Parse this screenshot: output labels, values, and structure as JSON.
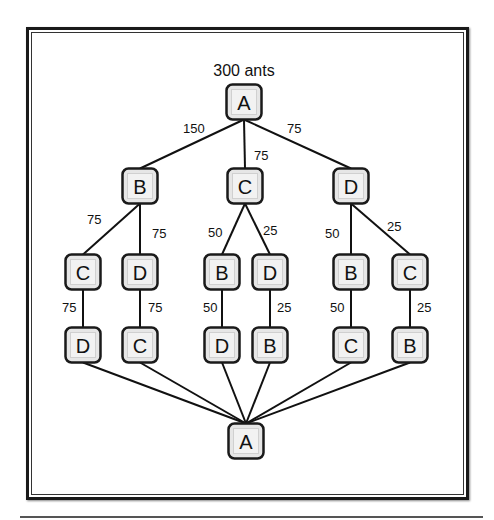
{
  "diagram": {
    "title": "300 ants",
    "node_size": 35,
    "colors": {
      "node_fill": "#e6e6e6",
      "node_inner": "#f2f2f2",
      "node_border": "#1a1a1a",
      "edge": "#111111"
    },
    "nodes": [
      {
        "id": "n0",
        "label": "A",
        "x": 244,
        "y": 102
      },
      {
        "id": "n1",
        "label": "B",
        "x": 140,
        "y": 186
      },
      {
        "id": "n2",
        "label": "C",
        "x": 245,
        "y": 186
      },
      {
        "id": "n3",
        "label": "D",
        "x": 351,
        "y": 186
      },
      {
        "id": "n4",
        "label": "C",
        "x": 83,
        "y": 272
      },
      {
        "id": "n5",
        "label": "D",
        "x": 140,
        "y": 272
      },
      {
        "id": "n6",
        "label": "B",
        "x": 222,
        "y": 272
      },
      {
        "id": "n7",
        "label": "D",
        "x": 270,
        "y": 272
      },
      {
        "id": "n8",
        "label": "B",
        "x": 351,
        "y": 272
      },
      {
        "id": "n9",
        "label": "C",
        "x": 410,
        "y": 272
      },
      {
        "id": "n10",
        "label": "D",
        "x": 83,
        "y": 345
      },
      {
        "id": "n11",
        "label": "C",
        "x": 140,
        "y": 345
      },
      {
        "id": "n12",
        "label": "D",
        "x": 222,
        "y": 345
      },
      {
        "id": "n13",
        "label": "B",
        "x": 270,
        "y": 345
      },
      {
        "id": "n14",
        "label": "C",
        "x": 351,
        "y": 345
      },
      {
        "id": "n15",
        "label": "B",
        "x": 410,
        "y": 345
      },
      {
        "id": "n16",
        "label": "A",
        "x": 246,
        "y": 441
      }
    ],
    "edges": [
      {
        "from": "n0",
        "to": "n1",
        "label": "150",
        "lx": 183,
        "ly": 133
      },
      {
        "from": "n0",
        "to": "n2",
        "label": "75",
        "lx": 254,
        "ly": 160
      },
      {
        "from": "n0",
        "to": "n3",
        "label": "75",
        "lx": 287,
        "ly": 133
      },
      {
        "from": "n1",
        "to": "n4",
        "label": "75",
        "lx": 87,
        "ly": 224
      },
      {
        "from": "n1",
        "to": "n5",
        "label": "75",
        "lx": 152,
        "ly": 238
      },
      {
        "from": "n2",
        "to": "n6",
        "label": "50",
        "lx": 208,
        "ly": 237
      },
      {
        "from": "n2",
        "to": "n7",
        "label": "25",
        "lx": 263,
        "ly": 235
      },
      {
        "from": "n3",
        "to": "n8",
        "label": "50",
        "lx": 325,
        "ly": 238
      },
      {
        "from": "n3",
        "to": "n9",
        "label": "25",
        "lx": 387,
        "ly": 231
      },
      {
        "from": "n4",
        "to": "n10",
        "label": "75",
        "lx": 62,
        "ly": 312
      },
      {
        "from": "n5",
        "to": "n11",
        "label": "75",
        "lx": 148,
        "ly": 312
      },
      {
        "from": "n6",
        "to": "n12",
        "label": "50",
        "lx": 203,
        "ly": 312
      },
      {
        "from": "n7",
        "to": "n13",
        "label": "25",
        "lx": 277,
        "ly": 312
      },
      {
        "from": "n8",
        "to": "n14",
        "label": "50",
        "lx": 330,
        "ly": 312
      },
      {
        "from": "n9",
        "to": "n15",
        "label": "25",
        "lx": 417,
        "ly": 312
      },
      {
        "from": "n10",
        "to": "n16",
        "label": ""
      },
      {
        "from": "n11",
        "to": "n16",
        "label": ""
      },
      {
        "from": "n12",
        "to": "n16",
        "label": ""
      },
      {
        "from": "n13",
        "to": "n16",
        "label": ""
      },
      {
        "from": "n14",
        "to": "n16",
        "label": ""
      },
      {
        "from": "n15",
        "to": "n16",
        "label": ""
      }
    ]
  }
}
